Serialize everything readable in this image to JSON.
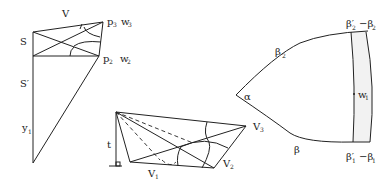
{
  "figure_left": {
    "labels": {
      "V": "V",
      "S": "S",
      "S_prime": "S′",
      "y1": "y",
      "y1_sub": "1",
      "p3": "p",
      "p3_sub": "3",
      "w3": "w",
      "w3_sub": "3",
      "p2": "p",
      "p2_sub": "2",
      "w2": "w",
      "w2_sub": "2"
    }
  },
  "figure_middle": {
    "labels": {
      "t": "t",
      "V1": "V",
      "V1_sub": "1",
      "V2": "V",
      "V2_sub": "2",
      "V3": "V",
      "V3_sub": "3"
    }
  },
  "figure_right": {
    "labels": {
      "alpha": "α",
      "beta2": "β",
      "beta2_sub": "2",
      "beta": "β",
      "w1": "w",
      "w1_sub": "1",
      "top_band": "β′",
      "top_band_sub": "2",
      "top_band_minus": "−β",
      "top_band_minus_sub": "2",
      "bottom_band": "β′",
      "bottom_band_sub": "1",
      "bottom_band_minus": "−β",
      "bottom_band_minus_sub": "1"
    },
    "band_fill": "#f2f2f2"
  }
}
